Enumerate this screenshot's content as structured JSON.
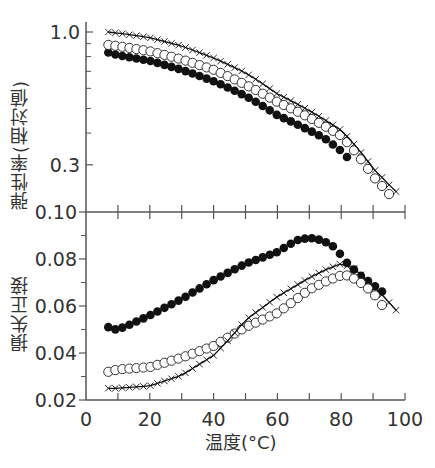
{
  "chart_data": [
    {
      "panel": "top",
      "type": "line",
      "title": "",
      "xlabel": "",
      "ylabel": "弾性率(相対値)",
      "yscale": "log",
      "ylim": [
        0.196,
        1.05
      ],
      "xlim": [
        0,
        100
      ],
      "yticks_labeled": [
        {
          "value": 1.0,
          "label": "1.0"
        },
        {
          "value": 0.3,
          "label": "0.3"
        }
      ],
      "yticks_minor": [
        0.9,
        0.8,
        0.7,
        0.6,
        0.5,
        0.4
      ],
      "grid": false,
      "series": [
        {
          "name": "filled-circles",
          "marker": "filled-circle",
          "line": false,
          "x": [
            7,
            10,
            20,
            30,
            40,
            50,
            60,
            70,
            75,
            80,
            83
          ],
          "values": [
            0.83,
            0.81,
            0.77,
            0.71,
            0.64,
            0.56,
            0.47,
            0.41,
            0.38,
            0.34,
            0.31
          ]
        },
        {
          "name": "open-circles",
          "marker": "open-circle",
          "line": false,
          "x": [
            7,
            10,
            20,
            30,
            40,
            50,
            60,
            70,
            80,
            85,
            90,
            95
          ],
          "values": [
            0.89,
            0.88,
            0.84,
            0.78,
            0.71,
            0.62,
            0.53,
            0.46,
            0.39,
            0.33,
            0.27,
            0.23
          ]
        },
        {
          "name": "crosses-with-line",
          "marker": "cross",
          "line": true,
          "x": [
            7,
            10,
            20,
            30,
            40,
            50,
            60,
            70,
            80,
            85,
            90,
            95,
            98
          ],
          "values": [
            1.0,
            0.99,
            0.95,
            0.88,
            0.79,
            0.69,
            0.57,
            0.49,
            0.41,
            0.35,
            0.29,
            0.25,
            0.23
          ]
        }
      ]
    },
    {
      "panel": "bottom",
      "type": "line",
      "title": "",
      "xlabel": "温度(°C)",
      "ylabel": "損失正接",
      "yscale": "linear",
      "ylim": [
        0.02,
        0.1
      ],
      "xlim": [
        0,
        100
      ],
      "yticks_labeled": [
        {
          "value": 0.1,
          "label": "0.10"
        },
        {
          "value": 0.08,
          "label": "0.08"
        },
        {
          "value": 0.06,
          "label": "0.06"
        },
        {
          "value": 0.04,
          "label": "0.04"
        },
        {
          "value": 0.02,
          "label": "0.02"
        }
      ],
      "yticks_minor": [
        0.09,
        0.07,
        0.05,
        0.03
      ],
      "xticks": [
        0,
        20,
        40,
        60,
        80,
        100
      ],
      "xticks_minor": [
        10,
        30,
        50,
        70,
        90
      ],
      "grid": false,
      "series": [
        {
          "name": "filled-circles",
          "marker": "filled-circle",
          "line": false,
          "x": [
            7,
            9,
            12,
            20,
            30,
            40,
            50,
            60,
            66,
            70,
            74,
            78,
            82,
            86,
            90,
            94
          ],
          "values": [
            0.051,
            0.05,
            0.051,
            0.056,
            0.063,
            0.071,
            0.078,
            0.083,
            0.088,
            0.089,
            0.088,
            0.085,
            0.078,
            0.073,
            0.069,
            0.065
          ]
        },
        {
          "name": "open-circles",
          "marker": "open-circle",
          "line": false,
          "x": [
            7,
            10,
            20,
            30,
            40,
            45,
            50,
            60,
            70,
            76,
            80,
            82,
            85,
            88,
            91,
            94
          ],
          "values": [
            0.032,
            0.033,
            0.034,
            0.038,
            0.043,
            0.047,
            0.051,
            0.057,
            0.067,
            0.071,
            0.073,
            0.073,
            0.071,
            0.068,
            0.064,
            0.058
          ]
        },
        {
          "name": "crosses-with-line",
          "marker": "cross",
          "line": true,
          "x": [
            7,
            10,
            20,
            30,
            40,
            45,
            50,
            60,
            70,
            76,
            80,
            84,
            88,
            92,
            96,
            98
          ],
          "values": [
            0.025,
            0.025,
            0.026,
            0.0305,
            0.039,
            0.046,
            0.054,
            0.064,
            0.072,
            0.076,
            0.078,
            0.076,
            0.071,
            0.066,
            0.06,
            0.057
          ]
        }
      ]
    }
  ],
  "labels": {
    "top_ylabel": "弾性率(相対値)",
    "bottom_ylabel": "損失正接",
    "xlabel": "温度(°C)"
  },
  "style": {
    "axis_color": "#555555",
    "marker_color": "#111111",
    "background": "#ffffff"
  }
}
